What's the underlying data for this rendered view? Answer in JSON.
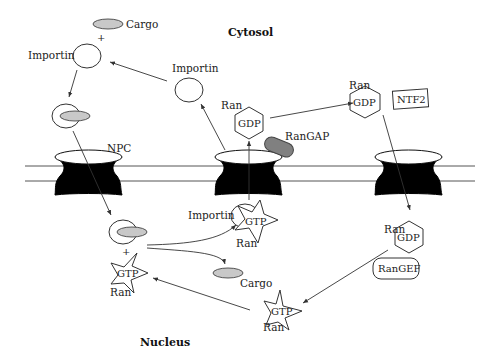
{
  "diagram": {
    "compartments": {
      "top": "Cytosol",
      "bottom": "Nucleus"
    },
    "labels": {
      "cargo_top": "Cargo",
      "plus_top": "+",
      "importin_left": "Importin",
      "importin_recycled": "Importin",
      "npc": "NPC",
      "ran_gdp_center_ran": "Ran",
      "ran_gdp_center_gdp": "GDP",
      "rangap": "RanGAP",
      "ran_gdp_right_ran": "Ran",
      "ran_gdp_right_gdp": "GDP",
      "ntf2": "NTF2",
      "importin_gtp_importin": "Importin",
      "importin_gtp_gtp": "GTP",
      "importin_gtp_ran": "Ran",
      "plus_bottom": "+",
      "ran_gtp_left_gtp": "GTP",
      "ran_gtp_left_ran": "Ran",
      "cargo_bottom": "Cargo",
      "ran_gdp_nuc_ran": "Ran",
      "ran_gdp_nuc_gdp": "GDP",
      "rangef": "RanGEF",
      "ran_gtp_bottom_gtp": "GTP",
      "ran_gtp_bottom_ran": "Ran"
    },
    "colors": {
      "cargo_fill": "#c8c8c8",
      "rangap_fill": "#808080",
      "pore_fill": "#000000",
      "line": "#333333"
    }
  }
}
